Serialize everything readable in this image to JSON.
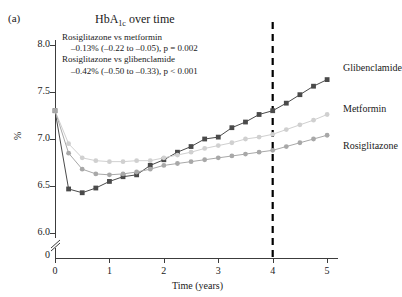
{
  "panel": {
    "label": "(a)"
  },
  "title": {
    "main": "HbA",
    "sub": "1c",
    "tail": " over time"
  },
  "annotation": {
    "line1": "Rosiglitazone vs metformin",
    "line2": "–0.13% (–0.22 to –0.05), p = 0.002",
    "line3": "Rosiglitazone vs glibenclamide",
    "line4": "–0.42% (–0.50 to –0.33), p < 0.001"
  },
  "legend": {
    "glibenclamide": "Glibenclamide",
    "metformin": "Metformin",
    "rosiglitazone": "Rosiglitazone"
  },
  "colors": {
    "glibenclamide": "#4a4a4a",
    "metformin": "#d0d0d0",
    "rosiglitazone": "#a8a8a8",
    "axis": "#3c3c3c",
    "marker_line": "#000000"
  },
  "chart_data": {
    "type": "line",
    "title": "HbA1c over time",
    "xlabel": "Time (years)",
    "ylabel": "%",
    "xlim": [
      0,
      5.2
    ],
    "ylim": [
      5.95,
      8.05
    ],
    "grid": false,
    "legend_position": "right",
    "xticks": [
      0,
      1,
      2,
      3,
      4,
      5
    ],
    "yticks": [
      6.0,
      6.5,
      7.0,
      7.5,
      8.0
    ],
    "yaxis_break_below": 6.0,
    "yaxis_zero_label": "0",
    "annotations": [
      {
        "type": "vline",
        "x": 4,
        "style": "dashed",
        "label": ""
      }
    ],
    "series": [
      {
        "name": "Glibenclamide",
        "marker": "square",
        "color": "#4a4a4a",
        "x": [
          0,
          0.25,
          0.5,
          0.75,
          1.0,
          1.25,
          1.5,
          1.75,
          2.0,
          2.25,
          2.5,
          2.75,
          3.0,
          3.25,
          3.5,
          3.75,
          4.0,
          4.25,
          4.5,
          4.75,
          5.0
        ],
        "y": [
          7.3,
          6.47,
          6.43,
          6.48,
          6.55,
          6.6,
          6.62,
          6.72,
          6.78,
          6.86,
          6.92,
          7.0,
          7.02,
          7.12,
          7.18,
          7.26,
          7.3,
          7.38,
          7.47,
          7.56,
          7.63
        ]
      },
      {
        "name": "Metformin",
        "marker": "circle",
        "color": "#d0d0d0",
        "x": [
          0,
          0.25,
          0.5,
          0.75,
          1.0,
          1.25,
          1.5,
          1.75,
          2.0,
          2.25,
          2.5,
          2.75,
          3.0,
          3.25,
          3.5,
          3.75,
          4.0,
          4.25,
          4.5,
          4.75,
          5.0
        ],
        "y": [
          7.3,
          6.95,
          6.8,
          6.77,
          6.76,
          6.76,
          6.77,
          6.77,
          6.8,
          6.83,
          6.86,
          6.9,
          6.93,
          6.96,
          7.0,
          7.02,
          7.05,
          7.1,
          7.15,
          7.2,
          7.26
        ]
      },
      {
        "name": "Rosiglitazone",
        "marker": "circle",
        "color": "#a8a8a8",
        "x": [
          0,
          0.25,
          0.5,
          0.75,
          1.0,
          1.25,
          1.5,
          1.75,
          2.0,
          2.25,
          2.5,
          2.75,
          3.0,
          3.25,
          3.5,
          3.75,
          4.0,
          4.25,
          4.5,
          4.75,
          5.0
        ],
        "y": [
          7.3,
          6.85,
          6.68,
          6.63,
          6.62,
          6.63,
          6.65,
          6.68,
          6.72,
          6.74,
          6.76,
          6.78,
          6.8,
          6.82,
          6.84,
          6.86,
          6.88,
          6.92,
          6.96,
          7.0,
          7.04
        ]
      }
    ]
  }
}
